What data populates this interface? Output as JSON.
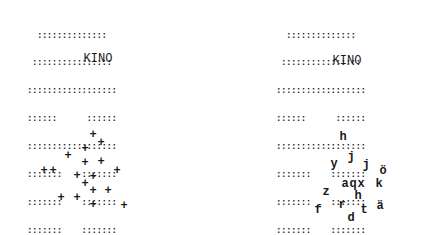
{
  "left": {
    "building": {
      "rows": [
        "  ::::::::::::::",
        " ::::::::::::::::",
        "::::::::::::::::::",
        "::::::      ::::::",
        "::::::::::::::::::",
        ":::::::    :::::::",
        ":::::::    :::::::",
        ":::::::    :::::::",
        ":::::::    :::::::"
      ],
      "sign": "KINO"
    },
    "crowd": {
      "glyph": "+",
      "points": [
        [
          93,
          135
        ],
        [
          101,
          143
        ],
        [
          85,
          149
        ],
        [
          68,
          156
        ],
        [
          85,
          163
        ],
        [
          101,
          162
        ],
        [
          44,
          171
        ],
        [
          53,
          171
        ],
        [
          117,
          171
        ],
        [
          77,
          176
        ],
        [
          93,
          177
        ],
        [
          85,
          184
        ],
        [
          93,
          191
        ],
        [
          108,
          191
        ],
        [
          61,
          198
        ],
        [
          77,
          198
        ],
        [
          93,
          205
        ],
        [
          124,
          206
        ]
      ]
    }
  },
  "right": {
    "building": {
      "rows": [
        "  ::::::::::::::",
        " ::::::::::::::::",
        "::::::::::::::::::",
        "::::::      ::::::",
        "::::::::::::::::::",
        ":::::::    :::::::",
        ":::::::    :::::::",
        ":::::::    :::::::",
        ":::::::    :::::::"
      ],
      "sign": "KINO"
    },
    "crowd": {
      "letters": [
        {
          "ch": "h",
          "x": 343,
          "y": 137
        },
        {
          "ch": "j",
          "x": 351,
          "y": 157
        },
        {
          "ch": "y",
          "x": 334,
          "y": 164
        },
        {
          "ch": "j",
          "x": 366,
          "y": 165
        },
        {
          "ch": "ö",
          "x": 383,
          "y": 171
        },
        {
          "ch": "a",
          "x": 345,
          "y": 184
        },
        {
          "ch": "q",
          "x": 353,
          "y": 184
        },
        {
          "ch": "x",
          "x": 361,
          "y": 184
        },
        {
          "ch": "k",
          "x": 379,
          "y": 184
        },
        {
          "ch": "z",
          "x": 326,
          "y": 192
        },
        {
          "ch": "h",
          "x": 358,
          "y": 196
        },
        {
          "ch": "r",
          "x": 342,
          "y": 205
        },
        {
          "ch": "ä",
          "x": 380,
          "y": 206
        },
        {
          "ch": "f",
          "x": 318,
          "y": 210
        },
        {
          "ch": "t",
          "x": 364,
          "y": 210
        },
        {
          "ch": "d",
          "x": 351,
          "y": 218
        }
      ]
    }
  }
}
